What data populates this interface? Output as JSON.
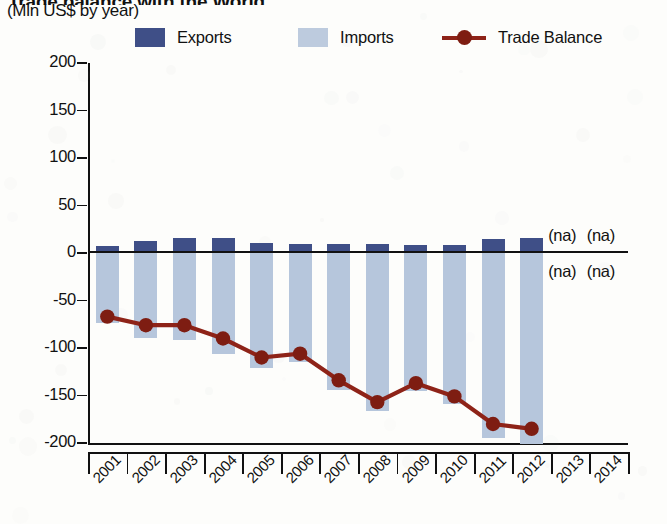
{
  "header": {
    "title_partial": "Trade balance with the World",
    "subtitle": "(Mln US$ by year)"
  },
  "legend": {
    "exports_label": "Exports",
    "imports_label": "Imports",
    "balance_label": "Trade Balance",
    "exports_color": "#3f4f87",
    "imports_color": "#bdcbde",
    "balance_color": "#8e2318"
  },
  "axes": {
    "y_ticks": [
      "200",
      "150",
      "100",
      "50",
      "0",
      "-50",
      "-100",
      "-150",
      "-200"
    ],
    "y_values": [
      200,
      150,
      100,
      50,
      0,
      -50,
      -100,
      -150,
      -200
    ],
    "x_ticks": [
      "2001",
      "2002",
      "2003",
      "2004",
      "2005",
      "2006",
      "2007",
      "2008",
      "2009",
      "2010",
      "2011",
      "2012",
      "2013",
      "2014"
    ]
  },
  "annotations": {
    "na_text": "(na)",
    "na_positions": [
      {
        "year": "2013",
        "side": "above"
      },
      {
        "year": "2014",
        "side": "above"
      },
      {
        "year": "2013",
        "side": "below"
      },
      {
        "year": "2014",
        "side": "below"
      }
    ]
  },
  "chart_data": {
    "type": "bar",
    "title": "Trade balance with the World",
    "subtitle": "(Mln US$ by year)",
    "xlabel": "",
    "ylabel": "Mln US$",
    "ylim": [
      -200,
      200
    ],
    "ytick_step": 50,
    "grid": false,
    "legend_position": "top",
    "categories": [
      "2001",
      "2002",
      "2003",
      "2004",
      "2005",
      "2006",
      "2007",
      "2008",
      "2009",
      "2010",
      "2011",
      "2012",
      "2013",
      "2014"
    ],
    "series": [
      {
        "name": "Exports",
        "type": "bar",
        "color": "#3f4f87",
        "values": [
          7,
          13,
          16,
          16,
          11,
          9,
          10,
          9,
          8,
          8,
          15,
          16,
          null,
          null
        ]
      },
      {
        "name": "Imports",
        "type": "bar",
        "color": "#b6c6dc",
        "values": [
          -74,
          -89,
          -92,
          -106,
          -121,
          -115,
          -144,
          -166,
          -145,
          -159,
          -195,
          -201,
          null,
          null
        ]
      },
      {
        "name": "Trade Balance",
        "type": "line",
        "color": "#8e2318",
        "values": [
          -67,
          -76,
          -76,
          -90,
          -110,
          -106,
          -134,
          -157,
          -137,
          -151,
          -180,
          -185,
          null,
          null
        ]
      }
    ]
  }
}
